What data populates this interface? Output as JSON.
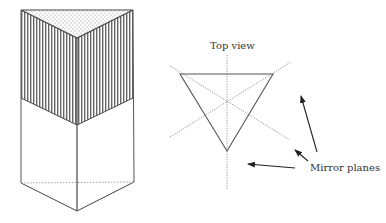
{
  "diagram": {
    "labels": {
      "top_view": "Top view",
      "mirror_planes": "Mirror planes"
    },
    "prism": {
      "description": "Triangular prism drawn in perspective; top face dotted, upper portion of side faces vertically hatched, lower portion plain, hidden back edge dotted",
      "top_face_pattern": "dots",
      "side_band_pattern": "vertical-stripes"
    },
    "top_view": {
      "shape": "inverted equilateral triangle",
      "mirror_plane_count": 3
    },
    "arrows_count": 3,
    "colors": {
      "line": "#555555",
      "hatch": "#666666",
      "dots": "#999999",
      "dashed": "#888888",
      "text": "#333333"
    }
  }
}
